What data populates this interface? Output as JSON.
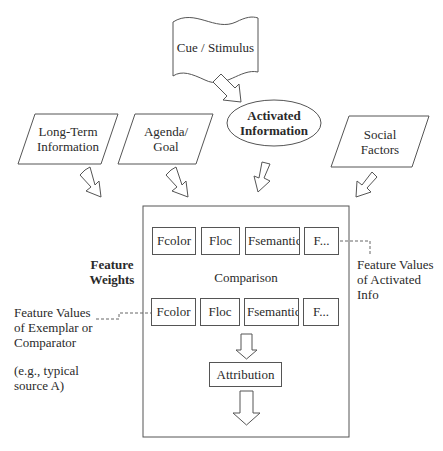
{
  "diagram": {
    "nodes": {
      "cue": {
        "label": "Cue / Stimulus",
        "shape": "wavy-banner"
      },
      "activated": {
        "label_line1": "Activated",
        "label_line2": "Information",
        "shape": "ellipse"
      },
      "long_term": {
        "label_line1": "Long-Term",
        "label_line2": "Information",
        "shape": "parallelogram"
      },
      "agenda": {
        "label_line1": "Agenda/",
        "label_line2": "Goal",
        "shape": "parallelogram"
      },
      "social": {
        "label_line1": "Social",
        "label_line2": "Factors",
        "shape": "parallelogram"
      }
    },
    "comparison_box": {
      "center_label": "Comparison",
      "row_top": [
        "Fcolor",
        "Floc",
        "Fsemantic",
        "F..."
      ],
      "row_bottom": [
        "Fcolor",
        "Floc",
        "Fsemantic",
        "F..."
      ],
      "attribution_label": "Attribution"
    },
    "annotations": {
      "feature_weights_line1": "Feature",
      "feature_weights_line2": "Weights",
      "activated_values_line1": "Feature Values",
      "activated_values_line2": "of Activated",
      "activated_values_line3": "Info",
      "exemplar_line1": "Feature Values",
      "exemplar_line2": "of Exemplar or",
      "exemplar_line3": "Comparator",
      "example_line1": "(e.g., typical",
      "example_line2": "source A)"
    },
    "edges": [
      {
        "from": "cue",
        "to": "activated"
      },
      {
        "from": "long_term",
        "to": "comparison_box"
      },
      {
        "from": "agenda",
        "to": "comparison_box"
      },
      {
        "from": "activated",
        "to": "comparison_box"
      },
      {
        "from": "social",
        "to": "comparison_box"
      },
      {
        "from": "comparison",
        "to": "attribution"
      },
      {
        "from": "attribution",
        "to": "output"
      }
    ],
    "colors": {
      "stroke": "#555555",
      "text": "#2a2a2a",
      "background": "#ffffff"
    }
  }
}
